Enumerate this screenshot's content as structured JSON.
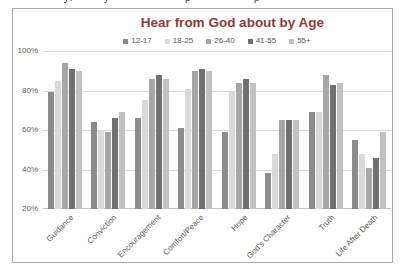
{
  "page": {
    "cropped_fragments": [
      {
        "char": "y",
        "x": 64
      },
      {
        "char": "l",
        "x": 70
      },
      {
        "char": "y",
        "x": 104
      },
      {
        "char": "p",
        "x": 185
      },
      {
        "char": "p",
        "x": 254
      }
    ]
  },
  "chart_data": {
    "type": "bar",
    "title": "Hear from God about by Age",
    "categories": [
      "Guidance",
      "Conviction",
      "Encouragement",
      "Comfort/Peace",
      "Hope",
      "God's Character",
      "Truth",
      "Life After Death"
    ],
    "series": [
      {
        "name": "12-17",
        "color": "#8c8c8c",
        "values": [
          79,
          64,
          66,
          61,
          59,
          38,
          69,
          55
        ]
      },
      {
        "name": "18-25",
        "color": "#d9d9d9",
        "values": [
          85,
          60,
          75,
          81,
          79,
          48,
          69,
          48
        ]
      },
      {
        "name": "26-40",
        "color": "#a6a6a6",
        "values": [
          94,
          59,
          86,
          90,
          84,
          65,
          88,
          41
        ]
      },
      {
        "name": "41-55",
        "color": "#707070",
        "values": [
          91,
          66,
          88,
          91,
          86,
          65,
          83,
          46
        ]
      },
      {
        "name": "55+",
        "color": "#c1c1c1",
        "values": [
          90,
          69,
          86,
          90,
          84,
          65,
          84,
          59
        ]
      }
    ],
    "y_ticks": [
      "100%",
      "80%",
      "60%",
      "40%",
      "20%"
    ],
    "ylim": [
      20,
      100
    ],
    "grid": true,
    "legend_position": "top",
    "colors": {
      "title_text": "#8b3c3c",
      "axis_text": "#595959",
      "gridline": "#d9d9d9",
      "chart_border": "#a9a9a9"
    }
  }
}
